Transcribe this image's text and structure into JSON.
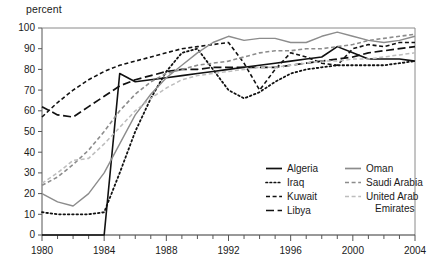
{
  "chart_data": {
    "type": "line",
    "title": "",
    "subtitle": "",
    "xlabel": "",
    "ylabel": "percent",
    "unit_label": "percent",
    "xlim": [
      1980,
      2004
    ],
    "ylim": [
      0,
      100
    ],
    "grid": false,
    "legend_position": "inside-bottom-right",
    "x_ticks_major": [
      1980,
      1984,
      1988,
      1992,
      1996,
      2000,
      2004
    ],
    "x_ticks_minor_step": 1,
    "y_ticks": [
      0,
      10,
      20,
      30,
      40,
      50,
      60,
      70,
      80,
      90,
      100
    ],
    "x": [
      1980,
      1981,
      1982,
      1983,
      1984,
      1985,
      1986,
      1987,
      1988,
      1989,
      1990,
      1991,
      1992,
      1993,
      1994,
      1995,
      1996,
      1997,
      1998,
      1999,
      2000,
      2001,
      2002,
      2003,
      2004
    ],
    "series": [
      {
        "name": "Algeria",
        "style": "solid",
        "color": "#111111",
        "width": 1.6,
        "values": [
          0,
          0,
          0,
          0,
          0,
          78,
          74,
          75,
          76,
          77,
          78,
          79,
          80,
          81,
          82,
          83,
          84,
          85,
          86,
          91,
          88,
          85,
          85,
          85,
          84
        ]
      },
      {
        "name": "Iraq",
        "style": "dotted",
        "color": "#111111",
        "width": 1.8,
        "values": [
          11,
          10,
          10,
          10,
          11,
          30,
          50,
          66,
          79,
          88,
          90,
          80,
          70,
          66,
          69,
          74,
          78,
          80,
          81,
          82,
          82,
          82,
          82,
          83,
          84
        ]
      },
      {
        "name": "Kuwait",
        "style": "dashed",
        "color": "#111111",
        "width": 1.6,
        "values": [
          57,
          64,
          70,
          75,
          79,
          82,
          84,
          86,
          88,
          90,
          91,
          92,
          93,
          83,
          70,
          80,
          88,
          86,
          83,
          82,
          90,
          92,
          91,
          93,
          93
        ]
      },
      {
        "name": "Libya",
        "style": "longdash",
        "color": "#111111",
        "width": 1.7,
        "values": [
          62,
          58,
          57,
          62,
          67,
          72,
          75,
          77,
          79,
          80,
          80,
          81,
          81,
          81,
          81,
          81,
          82,
          83,
          84,
          85,
          86,
          88,
          89,
          90,
          91
        ]
      },
      {
        "name": "Oman",
        "style": "solid",
        "color": "#8c8c8c",
        "width": 1.4,
        "values": [
          20,
          16,
          14,
          20,
          30,
          44,
          58,
          68,
          76,
          82,
          88,
          93,
          96,
          94,
          95,
          95,
          93,
          93,
          96,
          98,
          96,
          94,
          93,
          94,
          96
        ]
      },
      {
        "name": "Saudi Arabia",
        "style": "dashed",
        "color": "#8c8c8c",
        "width": 1.6,
        "values": [
          24,
          28,
          34,
          41,
          50,
          60,
          68,
          74,
          78,
          80,
          82,
          83,
          84,
          86,
          88,
          89,
          89,
          90,
          90,
          91,
          92,
          94,
          95,
          96,
          97
        ]
      },
      {
        "name": "United Arab Emirates",
        "style": "dashed",
        "color": "#bdbdbd",
        "width": 1.5,
        "values": [
          25,
          30,
          36,
          37,
          44,
          52,
          60,
          66,
          71,
          75,
          77,
          78,
          79,
          80,
          81,
          81,
          82,
          83,
          84,
          84,
          85,
          85,
          86,
          87,
          88
        ]
      }
    ],
    "legend": [
      {
        "label": "Algeria",
        "style": "solid",
        "color": "#111111"
      },
      {
        "label": "Iraq",
        "style": "dotted",
        "color": "#111111"
      },
      {
        "label": "Kuwait",
        "style": "dashed",
        "color": "#111111"
      },
      {
        "label": "Libya",
        "style": "longdash",
        "color": "#111111"
      },
      {
        "label": "Oman",
        "style": "solid",
        "color": "#8c8c8c"
      },
      {
        "label": "Saudi Arabia",
        "style": "dashed",
        "color": "#8c8c8c"
      },
      {
        "label": "United Arab Emirates",
        "style": "dashed",
        "color": "#bdbdbd"
      }
    ],
    "legend_wrapped": [
      {
        "line1": "United Arab",
        "line2": "Emirates"
      }
    ]
  }
}
